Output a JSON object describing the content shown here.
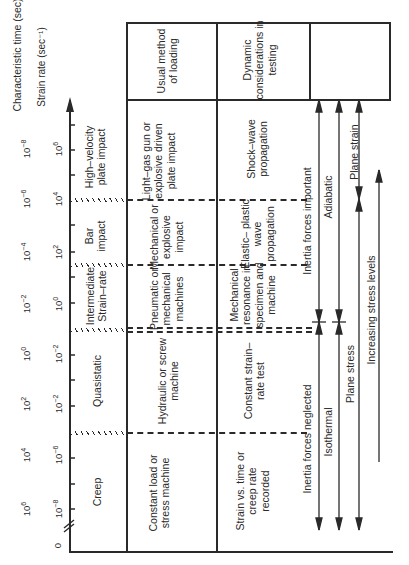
{
  "axes": {
    "characteristic_time": {
      "label": "Characteristic time (sec)",
      "ticks": [
        {
          "label": "10⁻⁸",
          "y": 150
        },
        {
          "label": "10⁻⁶",
          "y": 214
        },
        {
          "label": "10⁻⁴",
          "y": 298
        },
        {
          "label": "10⁻²",
          "y": 380
        },
        {
          "label": "10⁰",
          "y": 430
        },
        {
          "label": "10²",
          "y": 395
        },
        {
          "label": "10⁴",
          "y": 455
        },
        {
          "label": "10⁶",
          "y": 514
        }
      ]
    },
    "strain_rate": {
      "label": "Strain rate (sec⁻¹)",
      "ticks": [
        {
          "label": "10⁶",
          "y": 150
        },
        {
          "label": "10⁴",
          "y": 198
        },
        {
          "label": "10²",
          "y": 253
        },
        {
          "label": "10⁰",
          "y": 307
        },
        {
          "label": "10⁻²",
          "y": 357
        },
        {
          "label": "10⁻²",
          "y": 410
        },
        {
          "label": "10⁻⁶",
          "y": 459
        },
        {
          "label": "10⁻⁸",
          "y": 508
        }
      ],
      "origin_label": "0"
    }
  },
  "regimes": [
    {
      "name": "High–velocity plate impact",
      "method": "Light–gas gun or explosive driven plate impact",
      "dynamic": "Shock–wave propagation"
    },
    {
      "name": "Bar impact",
      "method": "Mechanical or explosive impact",
      "dynamic": "Elastic– plastic wave propagation"
    },
    {
      "name": "Intermediate Strain–rate",
      "method": "Pneumatic or mechanical machines",
      "dynamic": "Mechanical resonance in specimen and machine"
    },
    {
      "name": "Quasistatic",
      "method": "Hydraulic or screw machine",
      "dynamic": "Constant strain– rate test"
    },
    {
      "name": "Creep",
      "method": "Constant load or stress machine",
      "dynamic": "Strain vs. time or creep rate recorded"
    }
  ],
  "headers": {
    "method": "Usual method of loading",
    "dynamic": "Dynamic considerations in testing"
  },
  "arrows": {
    "inertia_important": "Inertia forces important",
    "inertia_neglected": "Inertia forces neglected",
    "adiabatic": "Adiabatic",
    "isothermal": "Isothermal",
    "plane_strain": "Plane strain",
    "plane_stress": "Plane stress",
    "increasing_stress": "Increasing stress levels"
  }
}
